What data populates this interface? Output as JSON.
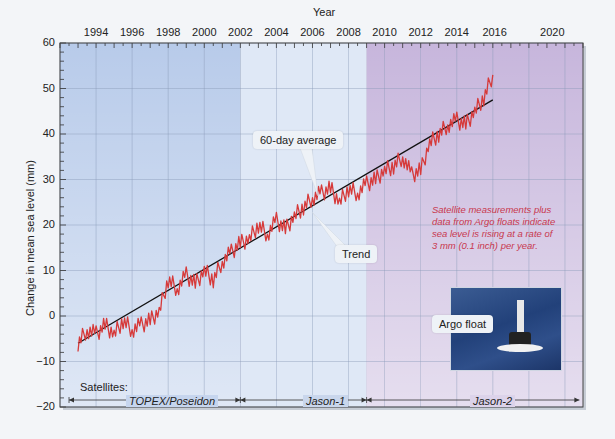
{
  "chart_data": {
    "type": "line",
    "title": "",
    "xlabel": "Year",
    "ylabel": "Change in mean sea level (mm)",
    "xlim": [
      1992,
      2021
    ],
    "ylim": [
      -20,
      60
    ],
    "x_ticks": [
      "1994",
      "1996",
      "1998",
      "2000",
      "2002",
      "2004",
      "2006",
      "2008",
      "2010",
      "2012",
      "2014",
      "2016",
      "2020"
    ],
    "y_ticks": [
      "60",
      "50",
      "40",
      "30",
      "20",
      "10",
      "0",
      "−10",
      "−20"
    ],
    "grid": true,
    "series": [
      {
        "name": "60-day average",
        "color": "#d63a3a",
        "x": [
          1993.0,
          1993.5,
          1994.0,
          1994.5,
          1995.0,
          1995.5,
          1996.0,
          1996.5,
          1997.0,
          1997.5,
          1998.0,
          1998.5,
          1999.0,
          1999.5,
          2000.0,
          2000.5,
          2001.0,
          2001.5,
          2002.0,
          2002.5,
          2003.0,
          2003.5,
          2004.0,
          2004.5,
          2005.0,
          2005.5,
          2006.0,
          2006.5,
          2007.0,
          2007.5,
          2008.0,
          2008.5,
          2009.0,
          2009.5,
          2010.0,
          2010.5,
          2011.0,
          2011.5,
          2012.0,
          2012.5,
          2013.0,
          2013.5,
          2014.0,
          2014.5,
          2015.0,
          2015.5,
          2016.0
        ],
        "values": [
          -6,
          -3,
          -4,
          -2,
          -4,
          -1,
          -3,
          -2,
          -1,
          1,
          8,
          6,
          9,
          7,
          10,
          8,
          12,
          14,
          16,
          17,
          20,
          18,
          21,
          19,
          22,
          24,
          26,
          27,
          28,
          25,
          28,
          27,
          29,
          30,
          32,
          33,
          35,
          31,
          32,
          38,
          40,
          42,
          43,
          42,
          45,
          48,
          53
        ]
      },
      {
        "name": "Trend",
        "color": "#111111",
        "x": [
          1993.0,
          2016.0
        ],
        "values": [
          -6,
          47.5
        ]
      }
    ],
    "regions": [
      {
        "name": "TOPEX/Poseidon",
        "x_start": 1992,
        "x_end": 2002,
        "color": "#b8cbea"
      },
      {
        "name": "Jason-1",
        "x_start": 2002,
        "x_end": 2009,
        "color": "#dfe8f6"
      },
      {
        "name": "Jason-2",
        "x_start": 2009,
        "x_end": 2021,
        "color": "#c7b6dc"
      }
    ],
    "annotations": [
      "60-day average",
      "Trend",
      "Satellite measurements plus data from Argo floats indicate sea level is rising at a rate of 3 mm (0.1 inch) per year.",
      "Argo float"
    ],
    "legend": "none"
  },
  "labels": {
    "xaxis_title": "Year",
    "yaxis_title": "Change in mean sea level (mm)",
    "callout_avg": "60-day average",
    "callout_trend": "Trend",
    "note_lines": [
      "Satellite measurements plus",
      "data from Argo floats indicate",
      "sea level is rising at a rate of",
      "3 mm (0.1 inch) per year."
    ],
    "argo_label": "Argo float",
    "satellites_label": "Satellites:",
    "sat1": "TOPEX/Poseidon",
    "sat2": "Jason-1",
    "sat3": "Jason-2"
  }
}
